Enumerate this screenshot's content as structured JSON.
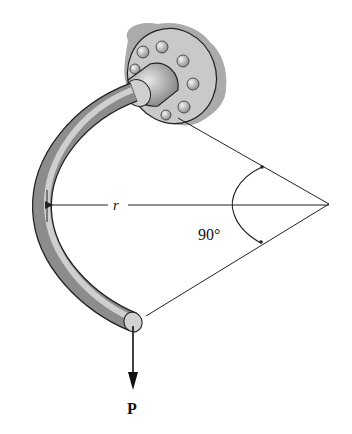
{
  "diagram": {
    "labels": {
      "radius": "r",
      "angle": "90°",
      "load": "P"
    },
    "colors": {
      "line": "#222222",
      "rod_dark": "#3a3a3a",
      "rod_light": "#d8d8d8",
      "wall_shade": "#9a9a9a",
      "background": "#ffffff"
    },
    "elements": [
      "wall-support-shading",
      "bolted-flange",
      "curved-rod",
      "radius-dimension-line",
      "angle-construction-lines",
      "angle-arc",
      "load-arrow"
    ]
  }
}
